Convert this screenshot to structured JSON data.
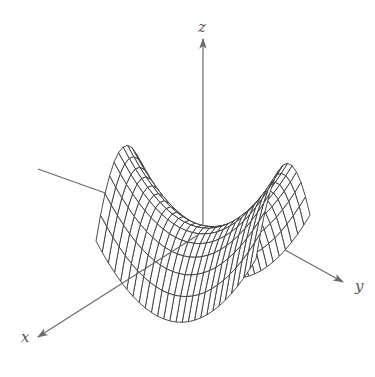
{
  "figure": {
    "type": "3d-surface-wireframe",
    "surface_equation": "z = y^2 - x^2",
    "surface_name": "hyperbolic paraboloid (saddle)",
    "background": "#ffffff",
    "line_color": "#3a3a3a",
    "axis_color": "#6a6a6a"
  },
  "axes": {
    "x": {
      "label": "x",
      "label_pos": [
        21,
        330
      ],
      "from": [
        203,
        228
      ],
      "to": [
        38,
        337
      ]
    },
    "y": {
      "label": "y",
      "label_pos": [
        355,
        279
      ],
      "from": [
        38,
        169
      ],
      "to": [
        343,
        282
      ]
    },
    "z": {
      "label": "z",
      "label_pos": [
        198,
        20
      ],
      "from": [
        203,
        228
      ],
      "to": [
        203,
        39
      ]
    }
  },
  "projection": {
    "origin": [
      203,
      228
    ],
    "x_vec": [
      -27,
      22
    ],
    "y_vec": [
      80,
      9
    ],
    "z_vec": [
      0,
      -72
    ]
  },
  "surface": {
    "x_range": [
      -1,
      1
    ],
    "y_range": [
      -1,
      1
    ],
    "x_lines": 12,
    "y_lines": 26
  },
  "chart_data": {
    "type": "surface",
    "title": "",
    "function": "z = y^2 - x^2",
    "xlabel": "x",
    "ylabel": "y",
    "zlabel": "z",
    "x_range": [
      -1,
      1
    ],
    "y_range": [
      -1,
      1
    ],
    "z_range": [
      -1,
      1
    ],
    "grid": false,
    "legend": null
  }
}
